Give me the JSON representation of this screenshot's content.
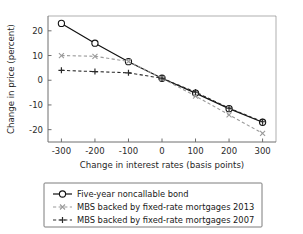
{
  "chart_data": {
    "type": "line",
    "title": "",
    "xlabel": "Change in interest rates (basis points)",
    "ylabel": "Change in price (percent)",
    "x": [
      -300,
      -200,
      -100,
      0,
      100,
      200,
      300
    ],
    "xlim": [
      -340,
      340
    ],
    "ylim": [
      -25,
      26
    ],
    "xticks": [
      -300,
      -200,
      -100,
      0,
      100,
      200,
      300
    ],
    "xticklabels": [
      "-300",
      "-200",
      "-100",
      "0",
      "100",
      "200",
      "300"
    ],
    "yticks": [
      -20,
      -10,
      0,
      10,
      20
    ],
    "yticklabels": [
      "-20",
      "-10",
      "0",
      "10",
      "20"
    ],
    "grid": false,
    "legend_position": "below-axes",
    "series": [
      {
        "name": "Five-year noncallable bond",
        "marker": "circle",
        "linestyle": "solid",
        "color": "#111111",
        "values": [
          23.0,
          15.0,
          7.5,
          0.8,
          -5.2,
          -11.5,
          -17.0
        ]
      },
      {
        "name": "MBS backed by fixed-rate mortgages 2013",
        "marker": "x",
        "linestyle": "dashed",
        "color": "#9a9a9a",
        "values": [
          10.0,
          9.7,
          7.6,
          0.8,
          -6.4,
          -14.0,
          -21.5
        ]
      },
      {
        "name": "MBS backed by fixed-rate mortgages 2007",
        "marker": "plus",
        "linestyle": "dashed",
        "color": "#2a2a2a",
        "values": [
          4.0,
          3.5,
          3.0,
          0.8,
          -4.8,
          -11.3,
          -16.8
        ]
      }
    ]
  },
  "legend": {
    "entries": [
      "Five-year noncallable bond",
      "MBS backed by fixed-rate mortgages 2013",
      "MBS backed by fixed-rate mortgages 2007"
    ]
  }
}
